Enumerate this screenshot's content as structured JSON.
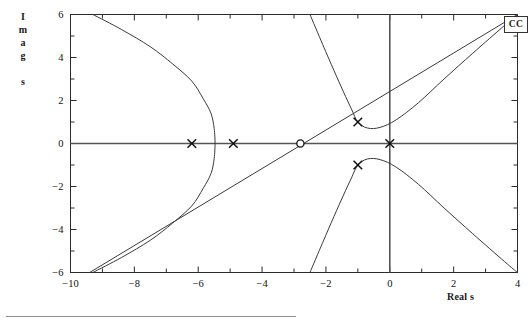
{
  "figure": {
    "badge": "CC",
    "xlabel": "Real s",
    "ylabel_chars": [
      "I",
      "m",
      "a",
      "g",
      "",
      "s"
    ]
  },
  "chart_data": {
    "type": "scatter",
    "title": "",
    "subtitle": "",
    "xlabel": "Real s",
    "ylabel": "Imag s",
    "xlim": [
      -10,
      4
    ],
    "ylim": [
      -6,
      6
    ],
    "grid": false,
    "legend": "none",
    "annotations": [
      "CC"
    ],
    "xticks": [
      -10,
      -8,
      -6,
      -4,
      -2,
      0,
      2,
      4
    ],
    "xtick_labels": [
      "-10",
      "-8",
      "-6",
      "-4",
      "-2",
      "0",
      "2",
      "4"
    ],
    "xminor_ticks": [
      -9,
      -7,
      -5,
      -3,
      -1,
      1,
      3
    ],
    "yticks": [
      6,
      4,
      2,
      0,
      -2,
      -4,
      -6
    ],
    "ytick_labels": [
      "6",
      "4",
      "2",
      "0",
      "-2",
      "-4",
      "-6"
    ],
    "yminor_ticks": [
      5,
      3,
      1,
      -1,
      -3,
      -5
    ],
    "poles": [
      {
        "re": -6.2,
        "im": 0,
        "marker": "x"
      },
      {
        "re": -4.9,
        "im": 0,
        "marker": "x"
      },
      {
        "re": -1.0,
        "im": 1.0,
        "marker": "x"
      },
      {
        "re": -1.0,
        "im": -1.0,
        "marker": "x"
      },
      {
        "re": 0.0,
        "im": 0.0,
        "marker": "x"
      }
    ],
    "zeros": [
      {
        "re": -2.8,
        "im": 0,
        "marker": "o"
      }
    ],
    "series": [
      {
        "name": "locus-real-axis-segment",
        "kind": "line",
        "points": [
          [
            -10,
            0
          ],
          [
            4,
            0
          ]
        ]
      },
      {
        "name": "locus-left-parabola-upper",
        "kind": "curve",
        "points": [
          [
            -9.3,
            6.0
          ],
          [
            -8.4,
            5.3
          ],
          [
            -7.5,
            4.5
          ],
          [
            -6.8,
            3.7
          ],
          [
            -6.2,
            2.9
          ],
          [
            -5.85,
            2.1
          ],
          [
            -5.6,
            1.4
          ],
          [
            -5.5,
            0.7
          ],
          [
            -5.47,
            0.0
          ]
        ]
      },
      {
        "name": "locus-left-parabola-lower",
        "kind": "curve",
        "points": [
          [
            -5.47,
            0.0
          ],
          [
            -5.5,
            -0.7
          ],
          [
            -5.6,
            -1.4
          ],
          [
            -5.85,
            -2.1
          ],
          [
            -6.2,
            -2.9
          ],
          [
            -6.8,
            -3.7
          ],
          [
            -7.5,
            -4.5
          ],
          [
            -8.4,
            -5.3
          ],
          [
            -9.3,
            -6.0
          ]
        ]
      },
      {
        "name": "asymptote-upper-left",
        "kind": "line",
        "points": [
          [
            -9.4,
            -6.0
          ],
          [
            4.0,
            6.0
          ]
        ]
      },
      {
        "name": "locus-complex-branch-upper",
        "kind": "curve",
        "points": [
          [
            -2.5,
            6.0
          ],
          [
            -2.1,
            4.6
          ],
          [
            -1.75,
            3.4
          ],
          [
            -1.45,
            2.4
          ],
          [
            -1.2,
            1.6
          ],
          [
            -1.0,
            1.0
          ],
          [
            -0.7,
            0.72
          ],
          [
            -0.3,
            0.75
          ],
          [
            0.2,
            1.1
          ],
          [
            0.9,
            1.9
          ],
          [
            1.7,
            3.0
          ],
          [
            2.6,
            4.2
          ],
          [
            3.6,
            5.5
          ],
          [
            4.0,
            6.0
          ]
        ]
      },
      {
        "name": "locus-complex-branch-lower",
        "kind": "curve",
        "points": [
          [
            -2.5,
            -6.0
          ],
          [
            -2.1,
            -4.6
          ],
          [
            -1.75,
            -3.4
          ],
          [
            -1.45,
            -2.4
          ],
          [
            -1.2,
            -1.6
          ],
          [
            -1.0,
            -1.0
          ],
          [
            -0.7,
            -0.72
          ],
          [
            -0.3,
            -0.75
          ],
          [
            0.2,
            -1.1
          ],
          [
            0.9,
            -1.9
          ],
          [
            1.7,
            -3.0
          ],
          [
            2.6,
            -4.2
          ],
          [
            3.6,
            -5.5
          ],
          [
            4.0,
            -6.0
          ]
        ]
      },
      {
        "name": "vertical-axis-line",
        "kind": "line",
        "points": [
          [
            0,
            -6
          ],
          [
            0,
            6
          ]
        ]
      }
    ]
  }
}
